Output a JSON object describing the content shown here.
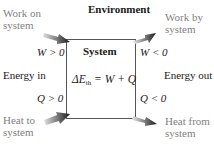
{
  "environment_label": "Environment",
  "system_label": "System",
  "equation": {
    "lhs_symbol": "ΔE",
    "lhs_subscript": "th",
    "rhs": " = W + Q"
  },
  "left": {
    "work_label_line1": "Work on",
    "work_label_line2": "system",
    "work_condition": "W > 0",
    "energy_label": "Energy in",
    "heat_condition": "Q > 0",
    "heat_label_line1": "Heat to",
    "heat_label_line2": "system"
  },
  "right": {
    "work_label_line1": "Work by",
    "work_label_line2": "system",
    "work_condition": "W < 0",
    "energy_label": "Energy out",
    "heat_condition": "Q < 0",
    "heat_label_line1": "Heat from",
    "heat_label_line2": "system"
  },
  "colors": {
    "box_stroke": "#555555",
    "arrow_dark": "#1a1a1a",
    "arrow_light": "#d0d0d0",
    "secondary_text": "#7f7f7f"
  }
}
